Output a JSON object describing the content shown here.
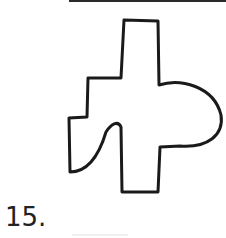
{
  "question": {
    "number_label": "15."
  },
  "figure": {
    "stroke_color": "#1a1a1a"
  }
}
